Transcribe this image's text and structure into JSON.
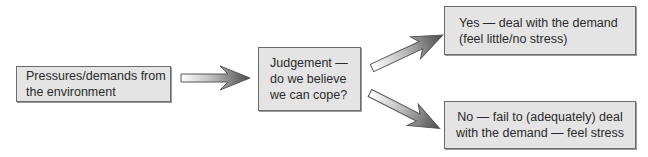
{
  "diagram": {
    "type": "flowchart",
    "nodes": [
      {
        "id": "pressures",
        "label": "Pressures/demands from\nthe environment"
      },
      {
        "id": "judgement",
        "label": "Judgement —\ndo we believe\nwe can cope?"
      },
      {
        "id": "yes",
        "label": "Yes — deal with the demand\n(feel little/no stress)"
      },
      {
        "id": "no",
        "label": "No — fail to (adequately) deal\nwith the demand — feel stress"
      }
    ],
    "edges": [
      {
        "from": "pressures",
        "to": "judgement"
      },
      {
        "from": "judgement",
        "to": "yes"
      },
      {
        "from": "judgement",
        "to": "no"
      }
    ],
    "colors": {
      "box_fill": "#e4e4e4",
      "box_border": "#6b6b6b",
      "arrow_light": "#ffffff",
      "arrow_dark": "#4a4a4a",
      "arrow_outline": "#555555",
      "text": "#2a2a2a"
    }
  }
}
